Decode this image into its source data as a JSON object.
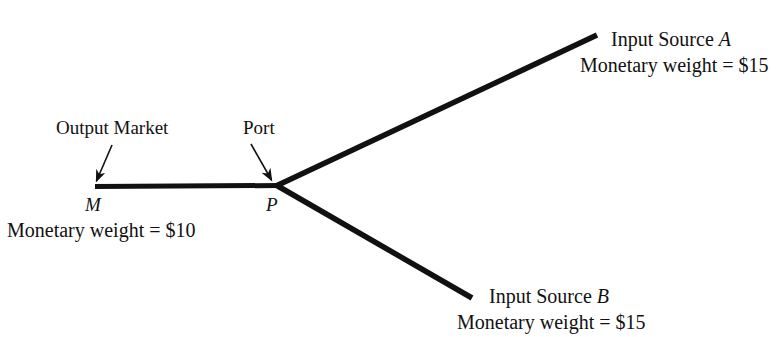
{
  "figure": {
    "background_color": "#ffffff",
    "line_color": "#111111",
    "text_color": "#111111"
  },
  "annotations": {
    "output_market": "Output Market",
    "port": "Port"
  },
  "nodes": {
    "market": {
      "letter": "M",
      "weight_caption": "Monetary weight = $10",
      "x": 95,
      "y": 186
    },
    "port": {
      "letter": "P",
      "x": 277,
      "y": 185
    }
  },
  "sources": {
    "a": {
      "title_prefix": "Input Source ",
      "title_letter": "A",
      "weight_caption": "Monetary weight = $15",
      "endpoint_x": 597,
      "endpoint_y": 35
    },
    "b": {
      "title_prefix": "Input Source ",
      "title_letter": "B",
      "weight_caption": "Monetary weight = $15",
      "endpoint_x": 472,
      "endpoint_y": 298
    }
  },
  "edges": [
    {
      "name": "market-to-port",
      "x1": 95,
      "y1": 186,
      "x2": 277,
      "y2": 185,
      "width": 5
    },
    {
      "name": "port-to-source-a",
      "x1": 277,
      "y1": 185,
      "x2": 597,
      "y2": 35,
      "width": 5
    },
    {
      "name": "port-to-source-b",
      "x1": 277,
      "y1": 185,
      "x2": 472,
      "y2": 298,
      "width": 5
    }
  ],
  "pointers": [
    {
      "name": "output-market-pointer",
      "x1": 110,
      "y1": 146,
      "x2": 95,
      "y2": 182
    },
    {
      "name": "port-pointer",
      "x1": 252,
      "y1": 145,
      "x2": 272,
      "y2": 181
    }
  ]
}
